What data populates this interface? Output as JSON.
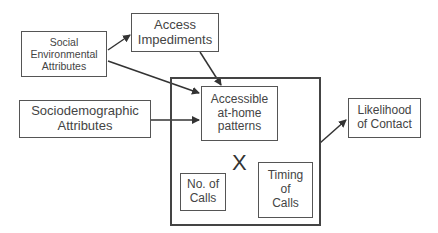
{
  "diagram": {
    "nodes": {
      "social_env": "Social\nEnvironmental\nAttributes",
      "access_impediments": "Access\nImpediments",
      "sociodemographic": "Sociodemographic\nAttributes",
      "accessible_patterns": "Accessible\nat-home\npatterns",
      "no_of_calls": "No. of\nCalls",
      "timing_of_calls": "Timing\nof\nCalls",
      "likelihood": "Likelihood\nof Contact"
    },
    "interaction_symbol": "X",
    "edges": [
      {
        "from": "Social Environmental Attributes",
        "to": "Access Impediments"
      },
      {
        "from": "Social Environmental Attributes",
        "to": "Accessible at-home patterns"
      },
      {
        "from": "Access Impediments",
        "to": "Accessible at-home patterns"
      },
      {
        "from": "Sociodemographic Attributes",
        "to": "Accessible at-home patterns"
      },
      {
        "from": "Accessible at-home patterns X No. of Calls X Timing of Calls",
        "to": "Likelihood of Contact"
      }
    ],
    "colors": {
      "line": "#444444",
      "text": "#444444",
      "background": "#ffffff"
    }
  }
}
